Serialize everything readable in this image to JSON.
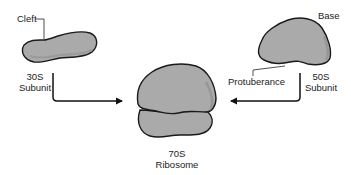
{
  "diagram": {
    "subunit_30s": {
      "title": "30S",
      "subtitle": "Subunit",
      "feature_label": "Cleft"
    },
    "subunit_50s": {
      "title": "50S",
      "subtitle": "Subunit",
      "feature_label_top": "Base",
      "feature_label_bottom": "Protuberance"
    },
    "ribosome_70s": {
      "title": "70S",
      "subtitle": "Ribosome"
    },
    "colors": {
      "shape_fill": "#a9a9a9",
      "shape_shadow": "#8e8e8e",
      "outline": "#1a1a1a",
      "arrow": "#111111",
      "text": "#222222"
    }
  }
}
